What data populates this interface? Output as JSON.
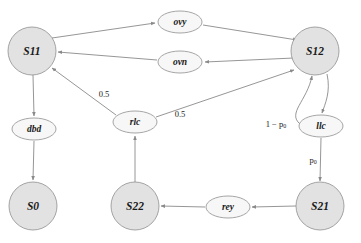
{
  "diagram": {
    "type": "state-transition-diagram",
    "colors": {
      "state_fill": "#e2e2e2",
      "transition_fill": "#f7f7f7",
      "stroke": "#8f8f8f",
      "edge": "#8a8a8a",
      "text": "#1a1a1a",
      "background": "#ffffff"
    },
    "states": [
      {
        "id": "S11",
        "label": "S11",
        "cx": 32,
        "cy": 51,
        "r": 24
      },
      {
        "id": "S12",
        "label": "S12",
        "cx": 315,
        "cy": 51,
        "r": 24
      },
      {
        "id": "S0",
        "label": "S0",
        "cx": 33,
        "cy": 206,
        "r": 24
      },
      {
        "id": "S22",
        "label": "S22",
        "cx": 135,
        "cy": 206,
        "r": 24
      },
      {
        "id": "S21",
        "label": "S21",
        "cx": 320,
        "cy": 206,
        "r": 24
      }
    ],
    "transitions": [
      {
        "id": "ovy",
        "label": "ovy",
        "cx": 180,
        "cy": 22,
        "rx": 22,
        "ry": 11
      },
      {
        "id": "ovn",
        "label": "ovn",
        "cx": 180,
        "cy": 62,
        "rx": 22,
        "ry": 11
      },
      {
        "id": "dbd",
        "label": "dbd",
        "cx": 34,
        "cy": 129,
        "rx": 22,
        "ry": 11
      },
      {
        "id": "rlc",
        "label": "rlc",
        "cx": 135,
        "cy": 122,
        "rx": 22,
        "ry": 11
      },
      {
        "id": "llc",
        "label": "llc",
        "cx": 321,
        "cy": 126,
        "rx": 22,
        "ry": 11
      },
      {
        "id": "rey",
        "label": "rey",
        "cx": 228,
        "cy": 207,
        "rx": 22,
        "ry": 11
      }
    ],
    "edges": [
      {
        "from": "S11",
        "to": "ovy",
        "weight": ""
      },
      {
        "from": "ovy",
        "to": "S12",
        "weight": ""
      },
      {
        "from": "S12",
        "to": "ovn",
        "weight": ""
      },
      {
        "from": "ovn",
        "to": "S11",
        "weight": ""
      },
      {
        "from": "S11",
        "to": "dbd",
        "weight": ""
      },
      {
        "from": "dbd",
        "to": "S0",
        "weight": ""
      },
      {
        "from": "rlc",
        "to": "S11",
        "weight": "0.5"
      },
      {
        "from": "rlc",
        "to": "S12",
        "weight": "0.5"
      },
      {
        "from": "S22",
        "to": "rlc",
        "weight": ""
      },
      {
        "from": "S12",
        "to": "llc",
        "weight": ""
      },
      {
        "from": "llc",
        "to": "S12",
        "weight": "1 − p₀"
      },
      {
        "from": "llc",
        "to": "S21",
        "weight": "p₀"
      },
      {
        "from": "S21",
        "to": "rey",
        "weight": ""
      },
      {
        "from": "rey",
        "to": "S22",
        "weight": ""
      }
    ],
    "labels": {
      "weight_rlc_to_s11": "0.5",
      "weight_rlc_to_s12": "0.5",
      "weight_one_minus_p0_main": "1 − p",
      "weight_one_minus_p0_sub": "0",
      "weight_p0_main": "p",
      "weight_p0_sub": "0"
    }
  }
}
